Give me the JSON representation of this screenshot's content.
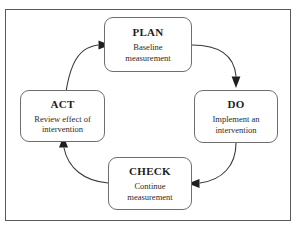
{
  "diagram": {
    "type": "cycle",
    "frame": {
      "border_color": "#5a5a5a",
      "background": "#ffffff"
    },
    "node_style": {
      "border_color": "#6e6e6e",
      "text_color": "#1d1d1d"
    },
    "arrow_color": "#3a3a3a",
    "nodes": [
      {
        "id": "plan",
        "title": "PLAN",
        "description": "Baseline measurement"
      },
      {
        "id": "do",
        "title": "DO",
        "description": "Implement an intervention"
      },
      {
        "id": "check",
        "title": "CHECK",
        "description": "Continue measurement"
      },
      {
        "id": "act",
        "title": "ACT",
        "description": "Review effect of intervention"
      }
    ],
    "connectors": [
      {
        "id": "plan-to-do",
        "from": "plan",
        "to": "do",
        "direction": "down"
      },
      {
        "id": "do-to-check",
        "from": "do",
        "to": "check",
        "direction": "left"
      },
      {
        "id": "check-to-act",
        "from": "check",
        "to": "act",
        "direction": "up"
      },
      {
        "id": "act-to-plan",
        "from": "act",
        "to": "plan",
        "direction": "right"
      }
    ]
  }
}
